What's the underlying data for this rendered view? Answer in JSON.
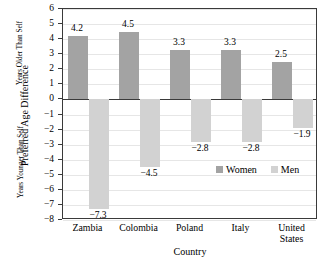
{
  "chart_data": {
    "type": "bar",
    "title": "",
    "xlabel": "Country",
    "ylabel": "Preferred Age Difference",
    "ylabel_upper": "Years Older Than Self",
    "ylabel_lower": "Years Younger Than Self",
    "ylim": [
      -8,
      6
    ],
    "ytick_step": 1,
    "yticks": [
      "6",
      "5",
      "4",
      "3",
      "2",
      "1",
      "0",
      "−1",
      "−2",
      "−3",
      "−4",
      "−5",
      "−6",
      "−7",
      "−8"
    ],
    "ytick_values": [
      6,
      5,
      4,
      3,
      2,
      1,
      0,
      -1,
      -2,
      -3,
      -4,
      -5,
      -6,
      -7,
      -8
    ],
    "grid": true,
    "legend_position": "inside-lower-right",
    "categories": [
      "Zambia",
      "Colombia",
      "Poland",
      "Italy",
      "United States"
    ],
    "category_label_lines": [
      [
        "Zambia"
      ],
      [
        "Colombia"
      ],
      [
        "Poland"
      ],
      [
        "Italy"
      ],
      [
        "United",
        "States"
      ]
    ],
    "series": [
      {
        "name": "Women",
        "color": "#a3a3a3",
        "values": [
          4.2,
          4.5,
          3.3,
          3.3,
          2.5
        ],
        "labels": [
          "4.2",
          "4.5",
          "3.3",
          "3.3",
          "2.5"
        ]
      },
      {
        "name": "Men",
        "color": "#d2d2d2",
        "values": [
          -7.3,
          -4.5,
          -2.8,
          -2.8,
          -1.9
        ],
        "labels": [
          "−7.3",
          "−4.5",
          "−2.8",
          "−2.8",
          "−1.9"
        ]
      }
    ]
  },
  "legend": {
    "entries": [
      {
        "label": "Women",
        "color": "#a3a3a3"
      },
      {
        "label": "Men",
        "color": "#d2d2d2"
      }
    ]
  },
  "colors": {
    "women": "#a3a3a3",
    "men": "#d2d2d2",
    "axis": "#3a3a3a",
    "grid": "#e6e6e6",
    "background": "#ffffff"
  }
}
